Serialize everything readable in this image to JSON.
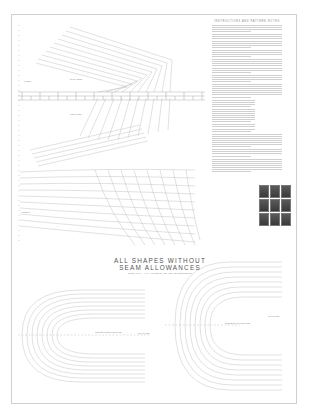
{
  "document": {
    "heading_line1": "ALL SHAPES WITHOUT",
    "heading_line2": "SEAM ALLOWANCES",
    "subheading": "SIZE 0/00 - 0/0 AMPERSAND MEASUREMENTS",
    "text_column": {
      "title": "INSTRUCTIONS AND PATTERN NOTES",
      "paragraph_count": 12
    },
    "labels": {
      "upper_left": "FRONT",
      "upper_mid": "BACK PIECE",
      "mid_left": "SLEEVE",
      "lower_mid": "SIDE PANEL",
      "bottom_left_center": "CENTER FRONT FOLD LINE",
      "bottom_left_right": "GRAIN LINE",
      "bottom_right_center": "CENTER BACK FOLD LINE",
      "bottom_right_right": "GRAIN LINE"
    },
    "photo_grid": {
      "rows": 3,
      "cols": 3
    }
  },
  "colors": {
    "paper": "#ffffff",
    "line": "#b5b5b5",
    "border": "#cfcfcf",
    "text": "#555555",
    "photo": "#4a4a4a"
  }
}
